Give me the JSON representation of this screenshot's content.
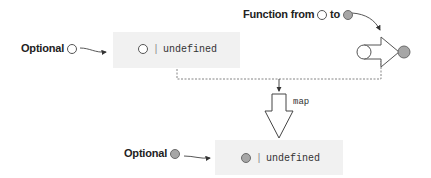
{
  "source_optional": {
    "label": "Optional",
    "symbol": "empty-circle",
    "type_expression": {
      "separator": "|",
      "text": "undefined"
    }
  },
  "function": {
    "label_prefix": "Function from",
    "label_middle": "to",
    "from_symbol": "empty-circle",
    "to_symbol": "filled-circle"
  },
  "operation": {
    "label": "map"
  },
  "result_optional": {
    "label": "Optional",
    "symbol": "filled-circle",
    "type_expression": {
      "separator": "|",
      "text": "undefined"
    }
  },
  "colors": {
    "box_fill": "#f1f1f1",
    "filled_circle": "#a6a6a6",
    "stroke": "#555555",
    "dashed_line": "#777777"
  }
}
